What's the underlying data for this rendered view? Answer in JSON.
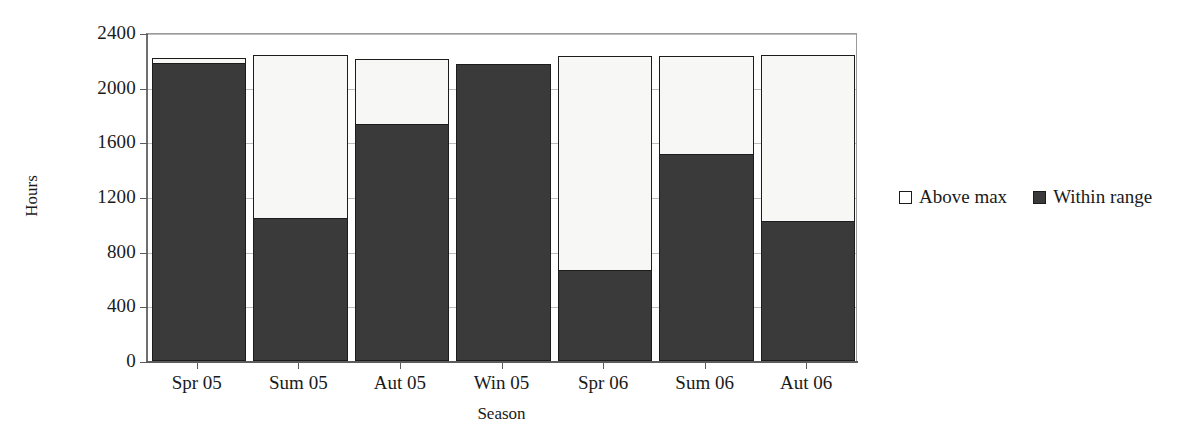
{
  "chart_data": {
    "type": "bar",
    "stacked": true,
    "title": "",
    "xlabel": "Season",
    "ylabel": "Hours",
    "ylim": [
      0,
      2400
    ],
    "ytick_step": 400,
    "yticks": [
      "0",
      "400",
      "800",
      "1200",
      "1600",
      "2000",
      "2400"
    ],
    "grid": true,
    "legend_position": "right",
    "categories": [
      "Spr 05",
      "Sum 05",
      "Aut 05",
      "Win 05",
      "Spr 06",
      "Sum 06",
      "Aut 06"
    ],
    "series": [
      {
        "name": "Within range",
        "color": "#3a3a3a",
        "values": [
          2170,
          1040,
          1730,
          2160,
          660,
          1505,
          1020
        ]
      },
      {
        "name": "Above max",
        "color": "#f7f7f5",
        "values": [
          40,
          1190,
          470,
          0,
          1565,
          715,
          1210
        ]
      }
    ],
    "totals": [
      2210,
      2230,
      2200,
      2160,
      2225,
      2220,
      2230
    ]
  },
  "legend": {
    "items": [
      {
        "label": "Above max",
        "swatch": "above"
      },
      {
        "label": "Within range",
        "swatch": "within"
      }
    ]
  }
}
